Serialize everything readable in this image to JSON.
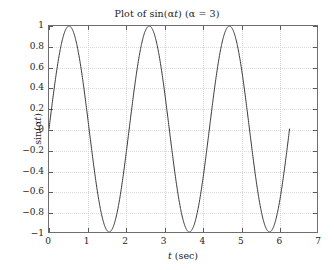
{
  "chart_data": {
    "type": "line",
    "title": "Plot of sin(αt)  (α = 3)",
    "title_parts": {
      "prefix": "Plot of sin(",
      "alpha": "α",
      "var": "t",
      "mid": ")  (",
      "alpha2": "α",
      "eq": " = 3)"
    },
    "xlabel": "t (sec)",
    "xlabel_parts": {
      "var": "t",
      "unit": " (sec)"
    },
    "ylabel": "sin(αt)",
    "ylabel_parts": {
      "prefix": "sin(",
      "alpha": "α",
      "var": "t",
      "suffix": ")"
    },
    "alpha": 3,
    "expression": "sin(3t)",
    "xlim": [
      0,
      7
    ],
    "ylim": [
      -1,
      1
    ],
    "xticks": [
      0,
      1,
      2,
      3,
      4,
      5,
      6,
      7
    ],
    "xtick_labels": [
      "0",
      "1",
      "2",
      "3",
      "4",
      "5",
      "6",
      "7"
    ],
    "yticks": [
      -1,
      -0.8,
      -0.6,
      -0.4,
      -0.2,
      0,
      0.2,
      0.4,
      0.6,
      0.8,
      1
    ],
    "ytick_labels": [
      "−1",
      "−0.8",
      "−0.6",
      "−0.4",
      "−0.2",
      "0",
      "0.2",
      "0.4",
      "0.6",
      "0.8",
      "1"
    ],
    "grid": true,
    "grid_style": "dotted",
    "legend": null,
    "x_data_range": [
      0,
      6.2832
    ],
    "period": 2.0944,
    "peaks_t": [
      0.5236,
      2.618,
      4.7124
    ],
    "troughs_t": [
      1.5708,
      3.6652,
      5.7596
    ],
    "zero_crossings_t": [
      0,
      1.0472,
      2.0944,
      3.1416,
      4.1888,
      5.236,
      6.2832
    ],
    "series": [
      {
        "name": "sin(3t)",
        "color": "#3a3a3a",
        "linewidth": 1,
        "x": [
          0,
          0.1309,
          0.2618,
          0.3927,
          0.5236,
          0.6545,
          0.7854,
          0.9163,
          1.0472,
          1.1781,
          1.309,
          1.4399,
          1.5708,
          1.7017,
          1.8326,
          1.9635,
          2.0944,
          2.2253,
          2.3562,
          2.4871,
          2.618,
          2.7489,
          2.8798,
          3.0107,
          3.1416,
          3.2725,
          3.4034,
          3.5343,
          3.6652,
          3.7961,
          3.927,
          4.0579,
          4.1888,
          4.3197,
          4.4506,
          4.5815,
          4.7124,
          4.8433,
          4.9742,
          5.1051,
          5.236,
          5.3669,
          5.4978,
          5.6287,
          5.7596,
          5.8905,
          6.0214,
          6.1523,
          6.2832
        ],
        "y": [
          0,
          0.3827,
          0.7071,
          0.9239,
          1,
          0.9239,
          0.7071,
          0.3827,
          0,
          -0.3827,
          -0.7071,
          -0.9239,
          -1,
          -0.9239,
          -0.7071,
          -0.3827,
          0,
          0.3827,
          0.7071,
          0.9239,
          1,
          0.9239,
          0.7071,
          0.3827,
          0,
          -0.3827,
          -0.7071,
          -0.9239,
          -1,
          -0.9239,
          -0.7071,
          -0.3827,
          0,
          0.3827,
          0.7071,
          0.9239,
          1,
          0.9239,
          0.7071,
          0.3827,
          0,
          -0.3827,
          -0.7071,
          -0.9239,
          -1,
          -0.9239,
          -0.7071,
          -0.3827,
          0
        ]
      }
    ],
    "colors": {
      "line": "#3a3a3a",
      "axis": "#6e6e6e",
      "grid": "#d9d9d9",
      "text": "#1c1c1c",
      "background": "#ffffff"
    }
  }
}
